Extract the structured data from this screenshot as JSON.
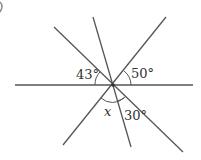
{
  "diagram": {
    "labels": {
      "angle_a": "43°",
      "angle_b": "50°",
      "angle_c": "30°",
      "angle_x": "x"
    },
    "colors": {
      "line": "#555555",
      "text": "#333333"
    }
  }
}
